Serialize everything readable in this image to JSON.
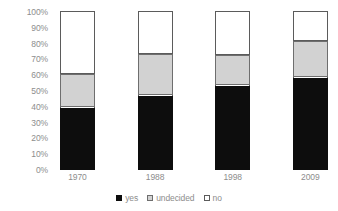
{
  "chart_data": {
    "type": "bar",
    "subtype": "stacked-percent-column",
    "title": "",
    "subtitle": "",
    "xlabel": "",
    "ylabel": "",
    "categories": [
      "1970",
      "1988",
      "1998",
      "2009"
    ],
    "series": [
      {
        "name": "yes",
        "color": "#0d0d0d",
        "values": [
          39,
          47,
          53,
          58
        ]
      },
      {
        "name": "undecided",
        "color": "#d2d2d2",
        "values": [
          21,
          26,
          19,
          23
        ]
      },
      {
        "name": "no",
        "color": "#ffffff",
        "values": [
          40,
          27,
          28,
          19
        ]
      }
    ],
    "ylim": [
      0,
      100
    ],
    "ytick_labels": [
      "100%",
      "90%",
      "80%",
      "70%",
      "60%",
      "50%",
      "40%",
      "30%",
      "20%",
      "10%",
      "0%"
    ],
    "ytick_values": [
      100,
      90,
      80,
      70,
      60,
      50,
      40,
      30,
      20,
      10,
      0
    ],
    "grid": false,
    "legend_position": "bottom",
    "legend_entries": [
      "yes",
      "undecided",
      "no"
    ],
    "annotations": [],
    "stack_order_bottom_to_top": [
      "yes",
      "undecided",
      "no"
    ],
    "value_unit": "percent"
  },
  "axis": {
    "y_ticks": [
      {
        "label": "100%",
        "value": 100
      },
      {
        "label": "90%",
        "value": 90
      },
      {
        "label": "80%",
        "value": 80
      },
      {
        "label": "70%",
        "value": 70
      },
      {
        "label": "60%",
        "value": 60
      },
      {
        "label": "50%",
        "value": 50
      },
      {
        "label": "40%",
        "value": 40
      },
      {
        "label": "30%",
        "value": 30
      },
      {
        "label": "20%",
        "value": 20
      },
      {
        "label": "10%",
        "value": 10
      },
      {
        "label": "0%",
        "value": 0
      }
    ]
  },
  "legend": {
    "items": [
      {
        "label": "yes",
        "swatch": "black-square-icon"
      },
      {
        "label": "undecided",
        "swatch": "gray-square-icon"
      },
      {
        "label": "no",
        "swatch": "white-square-icon"
      }
    ]
  }
}
